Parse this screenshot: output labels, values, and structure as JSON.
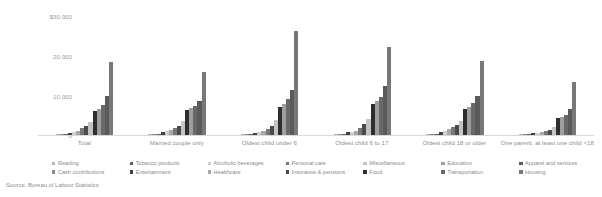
{
  "source_note": "Source: Bureau of Labour Statistics",
  "axis": {
    "y_ticks": [
      "$30,000",
      "20,000",
      "10,000",
      "0"
    ],
    "y_tick_values": [
      30000,
      20000,
      10000,
      0
    ]
  },
  "chart_data": {
    "type": "bar",
    "title": "",
    "subtitle": "",
    "xlabel": "",
    "ylabel": "",
    "ylim": [
      0,
      31000
    ],
    "grid": false,
    "legend_position": "bottom",
    "categories": [
      "Total",
      "Married couple only",
      "Oldest child under 6",
      "Oldest child 6 to 17",
      "Oldest child 18 or older",
      "One parent, at least one child <18"
    ],
    "series": [
      {
        "name": "Reading",
        "color": "#b4b4b4",
        "values": [
          118,
          150,
          95,
          120,
          140,
          60
        ]
      },
      {
        "name": "Cash contributions",
        "color": "#8c8c8c",
        "values": [
          260,
          330,
          200,
          240,
          300,
          130
        ]
      },
      {
        "name": "Tobacco products",
        "color": "#606060",
        "values": [
          320,
          330,
          250,
          300,
          360,
          280
        ]
      },
      {
        "name": "Entertainment",
        "color": "#3f3f3f",
        "values": [
          600,
          620,
          520,
          640,
          660,
          420
        ]
      },
      {
        "name": "Alcoholic beverages",
        "color": "#cfcfcf",
        "values": [
          800,
          900,
          760,
          820,
          880,
          520
        ]
      },
      {
        "name": "Healthcare",
        "color": "#a8a8a8",
        "values": [
          1100,
          1250,
          900,
          1050,
          1400,
          680
        ]
      },
      {
        "name": "Personal care",
        "color": "#777777",
        "values": [
          1600,
          1750,
          1500,
          1800,
          1900,
          1050
        ]
      },
      {
        "name": "Insurance & pensions",
        "color": "#4a4a4a",
        "values": [
          2100,
          2300,
          2250,
          2600,
          2400,
          1250
        ]
      },
      {
        "name": "Miscellaneous",
        "color": "#c4c4c4",
        "values": [
          3100,
          3300,
          3600,
          3900,
          3300,
          1900
        ]
      },
      {
        "name": "Food",
        "color": "#2e2e2e",
        "values": [
          5800,
          6100,
          6900,
          7600,
          6300,
          4100
        ]
      },
      {
        "name": "Education",
        "color": "#9e9e9e",
        "values": [
          6400,
          6600,
          7500,
          8300,
          6900,
          4400
        ]
      },
      {
        "name": "Transportation",
        "color": "#696969",
        "values": [
          7400,
          7200,
          8700,
          9400,
          7800,
          4900
        ]
      },
      {
        "name": "Apparel and services",
        "color": "#5a5a5a",
        "values": [
          9600,
          8300,
          11000,
          11900,
          9600,
          6400
        ]
      },
      {
        "name": "Housing",
        "color": "#787878",
        "values": [
          17800,
          15400,
          25500,
          21600,
          18000,
          13000
        ]
      }
    ]
  },
  "legend_columns": [
    {
      "items": [
        "Reading",
        "Cash contributions"
      ]
    },
    {
      "items": [
        "Tobacco products",
        "Entertainment"
      ]
    },
    {
      "items": [
        "Alcoholic beverages",
        "Healthcare"
      ]
    },
    {
      "items": [
        "Personal care",
        "Insurance & pensions"
      ]
    },
    {
      "items": [
        "Miscellaneous",
        "Food"
      ]
    },
    {
      "items": [
        "Education",
        "Transportation"
      ]
    },
    {
      "items": [
        "Apparel and services",
        "Housing"
      ]
    }
  ]
}
